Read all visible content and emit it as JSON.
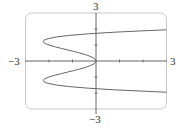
{
  "chart_data": {
    "type": "line",
    "title": "",
    "xlabel": "",
    "ylabel": "",
    "xlim": [
      -3,
      3
    ],
    "ylim": [
      -3,
      3
    ],
    "grid": false,
    "legend": null,
    "tick_labels": {
      "x_min": "−3",
      "x_max": "3",
      "y_min": "−3",
      "y_max": "3"
    },
    "series": [
      {
        "name": "curve",
        "description": "sideways quartic curve, x as a function of y (consistent with x = y^4 - 3y^2)",
        "points": [
          {
            "x": 3.05,
            "y": 1.95
          },
          {
            "x": 2.2,
            "y": 1.9
          },
          {
            "x": 0.78,
            "y": 1.8
          },
          {
            "x": -0.32,
            "y": 1.7
          },
          {
            "x": -1.13,
            "y": 1.6
          },
          {
            "x": -1.69,
            "y": 1.5
          },
          {
            "x": -2.04,
            "y": 1.4
          },
          {
            "x": -2.21,
            "y": 1.3
          },
          {
            "x": -2.25,
            "y": 1.2
          },
          {
            "x": -2.17,
            "y": 1.1
          },
          {
            "x": -2.0,
            "y": 1.0
          },
          {
            "x": -1.77,
            "y": 0.9
          },
          {
            "x": -1.51,
            "y": 0.8
          },
          {
            "x": -1.23,
            "y": 0.7
          },
          {
            "x": -0.95,
            "y": 0.6
          },
          {
            "x": -0.69,
            "y": 0.5
          },
          {
            "x": -0.45,
            "y": 0.4
          },
          {
            "x": -0.26,
            "y": 0.3
          },
          {
            "x": -0.12,
            "y": 0.2
          },
          {
            "x": -0.03,
            "y": 0.1
          },
          {
            "x": 0.0,
            "y": 0.0
          },
          {
            "x": -0.03,
            "y": -0.1
          },
          {
            "x": -0.12,
            "y": -0.2
          },
          {
            "x": -0.26,
            "y": -0.3
          },
          {
            "x": -0.45,
            "y": -0.4
          },
          {
            "x": -0.69,
            "y": -0.5
          },
          {
            "x": -0.95,
            "y": -0.6
          },
          {
            "x": -1.23,
            "y": -0.7
          },
          {
            "x": -1.51,
            "y": -0.8
          },
          {
            "x": -1.77,
            "y": -0.9
          },
          {
            "x": -2.0,
            "y": -1.0
          },
          {
            "x": -2.17,
            "y": -1.1
          },
          {
            "x": -2.25,
            "y": -1.2
          },
          {
            "x": -2.21,
            "y": -1.3
          },
          {
            "x": -2.04,
            "y": -1.4
          },
          {
            "x": -1.69,
            "y": -1.5
          },
          {
            "x": -1.13,
            "y": -1.6
          },
          {
            "x": -0.32,
            "y": -1.7
          },
          {
            "x": 0.78,
            "y": -1.8
          },
          {
            "x": 2.2,
            "y": -1.9
          },
          {
            "x": 3.05,
            "y": -1.95
          }
        ]
      }
    ],
    "x_ticks": [
      -3,
      -2,
      -1,
      0,
      1,
      2,
      3
    ],
    "y_ticks": [
      -3,
      -2,
      -1,
      0,
      1,
      2,
      3
    ]
  },
  "colors": {
    "frame": "#c8c8c8",
    "axis": "#555555",
    "curve": "#666666",
    "label": "#333333"
  }
}
